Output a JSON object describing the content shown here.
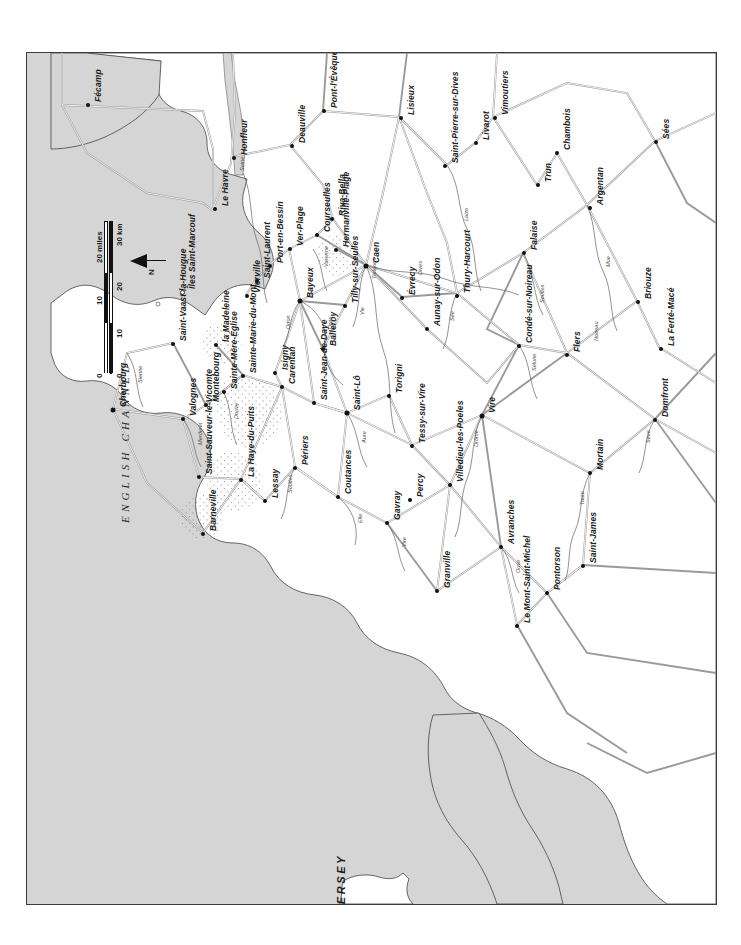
{
  "map": {
    "title": "Normandy — Cotentin, Calvados and Orne (D-Day region)",
    "orientation_note": "north-to-left (map printed sideways)",
    "colors": {
      "sea": "#d5d5d5",
      "land": "#ffffff",
      "frame": "#3b3b3b",
      "road": "#9a9a9a",
      "river": "#6d6d6d",
      "text": "#1b1b1b",
      "marsh_stipple": "#8a8a8a"
    },
    "sea_label": "E N G L I S H   C H A N N E L",
    "sea_label_plain": "ENGLISH CHANNEL",
    "island_label": "JERSEY",
    "scale": {
      "miles_unit": "20 miles",
      "km_unit": "30 km",
      "miles_ticks": [
        "0",
        "10",
        "20"
      ],
      "km_ticks": [
        "0",
        "10",
        "20",
        "30"
      ],
      "miles_max": 20,
      "km_max": 30
    },
    "north": {
      "letter": "N",
      "points": "left"
    },
    "towns": [
      {
        "name": "Fécamp",
        "x": 61,
        "y": 52,
        "size": "lg"
      },
      {
        "name": "Le Havre",
        "x": 188,
        "y": 156,
        "size": "lg"
      },
      {
        "name": "Honfleur",
        "x": 207,
        "y": 105,
        "size": "lg"
      },
      {
        "name": "Deauville",
        "x": 265,
        "y": 93,
        "size": "lg"
      },
      {
        "name": "Pont-l'Évêque",
        "x": 297,
        "y": 58,
        "size": "lg"
      },
      {
        "name": "Lisieux",
        "x": 374,
        "y": 65,
        "size": "lg"
      },
      {
        "name": "Vimoutiers",
        "x": 468,
        "y": 65,
        "size": "lg"
      },
      {
        "name": "Saint-Pierre-sur-Dives",
        "x": 418,
        "y": 113,
        "size": "lg"
      },
      {
        "name": "Livarot",
        "x": 449,
        "y": 90,
        "size": "lg"
      },
      {
        "name": "Chambois",
        "x": 530,
        "y": 100,
        "size": "lg"
      },
      {
        "name": "Trun",
        "x": 511,
        "y": 132,
        "size": "lg"
      },
      {
        "name": "Sées",
        "x": 629,
        "y": 89,
        "size": "lg"
      },
      {
        "name": "Argentan",
        "x": 563,
        "y": 155,
        "size": "lg"
      },
      {
        "name": "Falaise",
        "x": 497,
        "y": 200,
        "size": "lg"
      },
      {
        "name": "Briouze",
        "x": 611,
        "y": 249,
        "size": "lg"
      },
      {
        "name": "La Ferté-Macé",
        "x": 634,
        "y": 296,
        "size": "lg"
      },
      {
        "name": "Riva-Bella",
        "x": 305,
        "y": 166,
        "size": "lg"
      },
      {
        "name": "Courseulles",
        "x": 290,
        "y": 182,
        "size": "lg"
      },
      {
        "name": "Hermanville-Plage",
        "x": 309,
        "y": 197,
        "size": "lg"
      },
      {
        "name": "Ver-Plage",
        "x": 263,
        "y": 196,
        "size": "lg"
      },
      {
        "name": "Port-en-Bessin",
        "x": 243,
        "y": 213,
        "size": "lg"
      },
      {
        "name": "Saint-Laurent",
        "x": 230,
        "y": 228,
        "size": "lg"
      },
      {
        "name": "Vierville",
        "x": 220,
        "y": 243,
        "size": "lg"
      },
      {
        "name": "Caen",
        "x": 339,
        "y": 213,
        "size": "xl"
      },
      {
        "name": "Bayeux",
        "x": 273,
        "y": 248,
        "size": "xl"
      },
      {
        "name": "Tilly-sur-Seulles",
        "x": 318,
        "y": 253,
        "size": "lg"
      },
      {
        "name": "Évrecy",
        "x": 375,
        "y": 245,
        "size": "lg"
      },
      {
        "name": "Aunay-sur-Odon",
        "x": 400,
        "y": 276,
        "size": "lg"
      },
      {
        "name": "Thury-Harcourt",
        "x": 430,
        "y": 243,
        "size": "lg"
      },
      {
        "name": "Condé-sur-Noireau",
        "x": 492,
        "y": 293,
        "size": "lg"
      },
      {
        "name": "Flers",
        "x": 540,
        "y": 302,
        "size": "lg"
      },
      {
        "name": "Balleroy",
        "x": 296,
        "y": 296,
        "size": "lg"
      },
      {
        "name": "Saint-Jean-de-Daye",
        "x": 287,
        "y": 350,
        "size": "lg"
      },
      {
        "name": "Saint-Lô",
        "x": 320,
        "y": 360,
        "size": "xl"
      },
      {
        "name": "Torigni",
        "x": 362,
        "y": 343,
        "size": "lg"
      },
      {
        "name": "Tessy-sur-Vire",
        "x": 385,
        "y": 393,
        "size": "lg"
      },
      {
        "name": "Vire",
        "x": 455,
        "y": 363,
        "size": "xl"
      },
      {
        "name": "Percy",
        "x": 383,
        "y": 447,
        "size": "lg"
      },
      {
        "name": "Villedieu-les-Poeles",
        "x": 423,
        "y": 432,
        "size": "lg"
      },
      {
        "name": "Mortain",
        "x": 563,
        "y": 420,
        "size": "lg"
      },
      {
        "name": "Domfront",
        "x": 628,
        "y": 367,
        "size": "lg"
      },
      {
        "name": "Carentan",
        "x": 255,
        "y": 334,
        "size": "lg"
      },
      {
        "name": "Isigny",
        "x": 248,
        "y": 320,
        "size": "lg"
      },
      {
        "name": "Sainte-Mère-Église",
        "x": 197,
        "y": 339,
        "size": "lg"
      },
      {
        "name": "Sainte-Marie-du-Mont",
        "x": 216,
        "y": 323,
        "size": "lg"
      },
      {
        "name": "la Madeleine",
        "x": 189,
        "y": 292,
        "size": "lg"
      },
      {
        "name": "Montebourg",
        "x": 179,
        "y": 352,
        "size": "lg"
      },
      {
        "name": "Valognes",
        "x": 156,
        "y": 366,
        "size": "lg"
      },
      {
        "name": "Saint-Vaast-la-Hougue",
        "x": 146,
        "y": 291,
        "size": "lg"
      },
      {
        "name": "Cherbourg",
        "x": 86,
        "y": 357,
        "size": "xl"
      },
      {
        "name": "Saint-Sauveur-le-Vicomte",
        "x": 172,
        "y": 424,
        "size": "lg"
      },
      {
        "name": "Barneville",
        "x": 176,
        "y": 481,
        "size": "lg"
      },
      {
        "name": "La Haye-du-Puits",
        "x": 214,
        "y": 427,
        "size": "lg"
      },
      {
        "name": "Lessay",
        "x": 238,
        "y": 448,
        "size": "lg"
      },
      {
        "name": "Périers",
        "x": 268,
        "y": 415,
        "size": "lg"
      },
      {
        "name": "Coutances",
        "x": 311,
        "y": 444,
        "size": "lg"
      },
      {
        "name": "Gavray",
        "x": 360,
        "y": 470,
        "size": "lg"
      },
      {
        "name": "Granville",
        "x": 410,
        "y": 538,
        "size": "lg"
      },
      {
        "name": "Avranches",
        "x": 474,
        "y": 494,
        "size": "lg"
      },
      {
        "name": "Pontorson",
        "x": 520,
        "y": 540,
        "size": "lg"
      },
      {
        "name": "Saint-James",
        "x": 556,
        "y": 513,
        "size": "lg"
      },
      {
        "name": "Le Mont-Saint-Michel",
        "x": 490,
        "y": 573,
        "size": "lg"
      },
      {
        "name": "Îles Saint-Marcouf",
        "x": 155,
        "y": 239,
        "size": "none"
      }
    ],
    "rivers": [
      "Seine",
      "Touques",
      "Dives",
      "Vie",
      "Orne",
      "Odon",
      "Laize",
      "Seulles",
      "Mue",
      "Aure",
      "Drôme",
      "Elle",
      "Vire",
      "Taute",
      "Sève",
      "Ouve",
      "Merderet",
      "Douve",
      "Sienne",
      "Soulles",
      "Sélune",
      "Sée",
      "Varenne",
      "Noireau"
    ],
    "town_count": 62
  }
}
